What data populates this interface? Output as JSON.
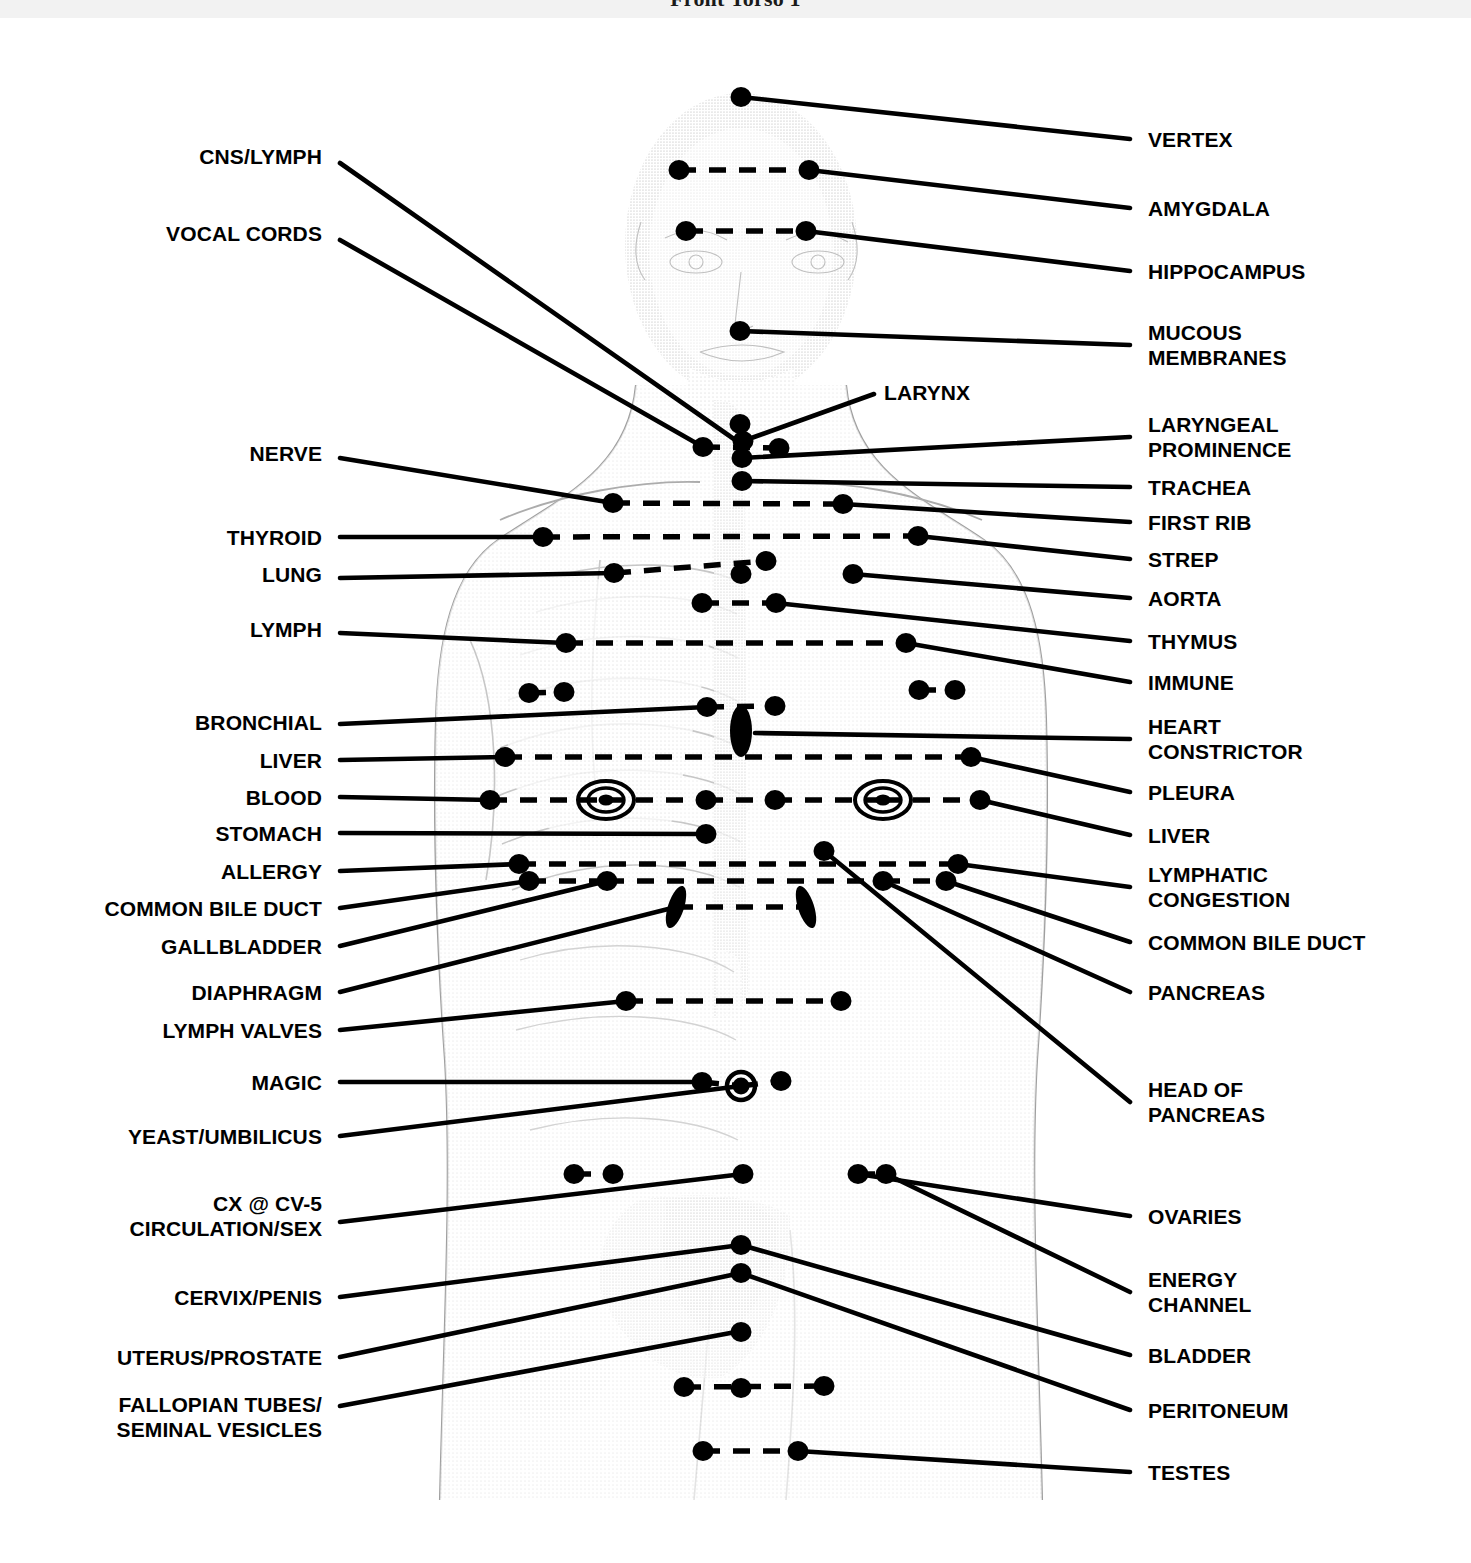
{
  "page": {
    "title": "Front Torso 1",
    "background_color": "#ffffff",
    "ink_color": "#000000",
    "figure_tint": "#c9c9c9"
  },
  "diagram": {
    "type": "anatomical-point-chart",
    "marker_types": [
      "solid-dot",
      "ringed-dot",
      "concentric-circle",
      "filled-oval"
    ],
    "connector_styles": [
      "solid-leader-line",
      "dashed-bilateral-link"
    ]
  },
  "left_labels": [
    {
      "text": "CNS/LYMPH",
      "x": 322,
      "y": 156,
      "tip_x": 340,
      "tip_y": 163,
      "end_x": 741,
      "end_y": 444
    },
    {
      "text": "VOCAL CORDS",
      "x": 322,
      "y": 233,
      "tip_x": 340,
      "tip_y": 240,
      "end_x": 703,
      "end_y": 447
    },
    {
      "text": "NERVE",
      "x": 322,
      "y": 453,
      "tip_x": 340,
      "tip_y": 458,
      "end_x": 613,
      "end_y": 503
    },
    {
      "text": "THYROID",
      "x": 322,
      "y": 537,
      "tip_x": 340,
      "tip_y": 537,
      "end_x": 543,
      "end_y": 537
    },
    {
      "text": "LUNG",
      "x": 322,
      "y": 574,
      "tip_x": 340,
      "tip_y": 578,
      "end_x": 614,
      "end_y": 573
    },
    {
      "text": "LYMPH",
      "x": 322,
      "y": 629,
      "tip_x": 340,
      "tip_y": 633,
      "end_x": 566,
      "end_y": 643
    },
    {
      "text": "BRONCHIAL",
      "x": 322,
      "y": 722,
      "tip_x": 340,
      "tip_y": 724,
      "end_x": 707,
      "end_y": 707
    },
    {
      "text": "LIVER",
      "x": 322,
      "y": 760,
      "tip_x": 340,
      "tip_y": 760,
      "end_x": 505,
      "end_y": 757
    },
    {
      "text": "BLOOD",
      "x": 322,
      "y": 797,
      "tip_x": 340,
      "tip_y": 797,
      "end_x": 490,
      "end_y": 800
    },
    {
      "text": "STOMACH",
      "x": 322,
      "y": 833,
      "tip_x": 340,
      "tip_y": 833,
      "end_x": 706,
      "end_y": 834
    },
    {
      "text": "ALLERGY",
      "x": 322,
      "y": 871,
      "tip_x": 340,
      "tip_y": 871,
      "end_x": 519,
      "end_y": 864
    },
    {
      "text": "COMMON BILE DUCT",
      "x": 322,
      "y": 908,
      "tip_x": 340,
      "tip_y": 908,
      "end_x": 529,
      "end_y": 881
    },
    {
      "text": "GALLBLADDER",
      "x": 322,
      "y": 946,
      "tip_x": 340,
      "tip_y": 946,
      "end_x": 607,
      "end_y": 881
    },
    {
      "text": "DIAPHRAGM",
      "x": 322,
      "y": 992,
      "tip_x": 340,
      "tip_y": 992,
      "end_x": 676,
      "end_y": 907
    },
    {
      "text": "LYMPH VALVES",
      "x": 322,
      "y": 1030,
      "tip_x": 340,
      "tip_y": 1030,
      "end_x": 626,
      "end_y": 1001
    },
    {
      "text": "MAGIC",
      "x": 322,
      "y": 1082,
      "tip_x": 340,
      "tip_y": 1082,
      "end_x": 702,
      "end_y": 1082
    },
    {
      "text": "YEAST/UMBILICUS",
      "x": 322,
      "y": 1136,
      "tip_x": 340,
      "tip_y": 1136,
      "end_x": 741,
      "end_y": 1086
    },
    {
      "text": "CX @ CV-5\nCIRCULATION/SEX",
      "x": 322,
      "y": 1216,
      "tip_x": 340,
      "tip_y": 1222,
      "end_x": 743,
      "end_y": 1174
    },
    {
      "text": "CERVIX/PENIS",
      "x": 322,
      "y": 1297,
      "tip_x": 340,
      "tip_y": 1297,
      "end_x": 741,
      "end_y": 1245
    },
    {
      "text": "UTERUS/PROSTATE",
      "x": 322,
      "y": 1357,
      "tip_x": 340,
      "tip_y": 1357,
      "end_x": 741,
      "end_y": 1273
    },
    {
      "text": "FALLOPIAN TUBES/\nSEMINAL VESICLES",
      "x": 322,
      "y": 1417,
      "tip_x": 340,
      "tip_y": 1406,
      "end_x": 741,
      "end_y": 1331
    }
  ],
  "right_labels": [
    {
      "text": "VERTEX",
      "x": 1148,
      "y": 139,
      "tip_x": 1130,
      "tip_y": 139,
      "end_x": 741,
      "end_y": 97
    },
    {
      "text": "AMYGDALA",
      "x": 1148,
      "y": 208,
      "tip_x": 1130,
      "tip_y": 208,
      "end_x": 809,
      "end_y": 170
    },
    {
      "text": "HIPPOCAMPUS",
      "x": 1148,
      "y": 271,
      "tip_x": 1130,
      "tip_y": 271,
      "end_x": 806,
      "end_y": 231
    },
    {
      "text": "MUCOUS\nMEMBRANES",
      "x": 1148,
      "y": 345,
      "tip_x": 1130,
      "tip_y": 345,
      "end_x": 740,
      "end_y": 331
    },
    {
      "text": "LARYNGEAL\nPROMINENCE",
      "x": 1148,
      "y": 437,
      "tip_x": 1130,
      "tip_y": 437,
      "end_x": 742,
      "end_y": 458
    },
    {
      "text": "TRACHEA",
      "x": 1148,
      "y": 487,
      "tip_x": 1130,
      "tip_y": 487,
      "end_x": 742,
      "end_y": 481
    },
    {
      "text": "FIRST RIB",
      "x": 1148,
      "y": 522,
      "tip_x": 1130,
      "tip_y": 522,
      "end_x": 843,
      "end_y": 504
    },
    {
      "text": "STREP",
      "x": 1148,
      "y": 559,
      "tip_x": 1130,
      "tip_y": 559,
      "end_x": 918,
      "end_y": 536
    },
    {
      "text": "AORTA",
      "x": 1148,
      "y": 598,
      "tip_x": 1130,
      "tip_y": 598,
      "end_x": 853,
      "end_y": 574
    },
    {
      "text": "THYMUS",
      "x": 1148,
      "y": 641,
      "tip_x": 1130,
      "tip_y": 641,
      "end_x": 776,
      "end_y": 603
    },
    {
      "text": "IMMUNE",
      "x": 1148,
      "y": 682,
      "tip_x": 1130,
      "tip_y": 682,
      "end_x": 906,
      "end_y": 643
    },
    {
      "text": "HEART\nCONSTRICTOR",
      "x": 1148,
      "y": 739,
      "tip_x": 1130,
      "tip_y": 739,
      "end_x": 755,
      "end_y": 733
    },
    {
      "text": "PLEURA",
      "x": 1148,
      "y": 792,
      "tip_x": 1130,
      "tip_y": 792,
      "end_x": 971,
      "end_y": 757
    },
    {
      "text": "LIVER",
      "x": 1148,
      "y": 835,
      "tip_x": 1130,
      "tip_y": 835,
      "end_x": 980,
      "end_y": 800
    },
    {
      "text": "LYMPHATIC\nCONGESTION",
      "x": 1148,
      "y": 887,
      "tip_x": 1130,
      "tip_y": 887,
      "end_x": 958,
      "end_y": 864
    },
    {
      "text": "COMMON BILE DUCT",
      "x": 1148,
      "y": 942,
      "tip_x": 1130,
      "tip_y": 942,
      "end_x": 946,
      "end_y": 881
    },
    {
      "text": "PANCREAS",
      "x": 1148,
      "y": 992,
      "tip_x": 1130,
      "tip_y": 992,
      "end_x": 883,
      "end_y": 881
    },
    {
      "text": "HEAD OF\nPANCREAS",
      "x": 1148,
      "y": 1102,
      "tip_x": 1130,
      "tip_y": 1102,
      "end_x": 824,
      "end_y": 851
    },
    {
      "text": "OVARIES",
      "x": 1148,
      "y": 1216,
      "tip_x": 1130,
      "tip_y": 1216,
      "end_x": 858,
      "end_y": 1174
    },
    {
      "text": "ENERGY\nCHANNEL",
      "x": 1148,
      "y": 1292,
      "tip_x": 1130,
      "tip_y": 1292,
      "end_x": 886,
      "end_y": 1174
    },
    {
      "text": "BLADDER",
      "x": 1148,
      "y": 1355,
      "tip_x": 1130,
      "tip_y": 1355,
      "end_x": 741,
      "end_y": 1245
    },
    {
      "text": "PERITONEUM",
      "x": 1148,
      "y": 1410,
      "tip_x": 1130,
      "tip_y": 1410,
      "end_x": 741,
      "end_y": 1273
    },
    {
      "text": "TESTES",
      "x": 1148,
      "y": 1472,
      "tip_x": 1130,
      "tip_y": 1472,
      "end_x": 798,
      "end_y": 1451
    }
  ],
  "inline_labels": [
    {
      "text": "LARYNX",
      "x": 884,
      "y": 392,
      "tip_x": 874,
      "tip_y": 394,
      "end_x": 743,
      "end_y": 441
    }
  ],
  "markers": {
    "dots": [
      {
        "x": 741,
        "y": 97
      },
      {
        "x": 679,
        "y": 170
      },
      {
        "x": 809,
        "y": 170
      },
      {
        "x": 686,
        "y": 231
      },
      {
        "x": 806,
        "y": 231
      },
      {
        "x": 740,
        "y": 331
      },
      {
        "x": 740,
        "y": 424
      },
      {
        "x": 743,
        "y": 441
      },
      {
        "x": 703,
        "y": 447
      },
      {
        "x": 779,
        "y": 448
      },
      {
        "x": 742,
        "y": 458
      },
      {
        "x": 742,
        "y": 481
      },
      {
        "x": 613,
        "y": 503
      },
      {
        "x": 843,
        "y": 504
      },
      {
        "x": 543,
        "y": 537
      },
      {
        "x": 918,
        "y": 536
      },
      {
        "x": 614,
        "y": 573
      },
      {
        "x": 766,
        "y": 561
      },
      {
        "x": 741,
        "y": 574
      },
      {
        "x": 853,
        "y": 574
      },
      {
        "x": 702,
        "y": 603
      },
      {
        "x": 776,
        "y": 603
      },
      {
        "x": 566,
        "y": 643
      },
      {
        "x": 906,
        "y": 643
      },
      {
        "x": 529,
        "y": 693
      },
      {
        "x": 564,
        "y": 692
      },
      {
        "x": 707,
        "y": 707
      },
      {
        "x": 775,
        "y": 706
      },
      {
        "x": 919,
        "y": 690
      },
      {
        "x": 955,
        "y": 690
      },
      {
        "x": 505,
        "y": 757
      },
      {
        "x": 971,
        "y": 757
      },
      {
        "x": 490,
        "y": 800
      },
      {
        "x": 706,
        "y": 800
      },
      {
        "x": 775,
        "y": 800
      },
      {
        "x": 980,
        "y": 800
      },
      {
        "x": 706,
        "y": 834
      },
      {
        "x": 519,
        "y": 864
      },
      {
        "x": 824,
        "y": 851
      },
      {
        "x": 958,
        "y": 864
      },
      {
        "x": 529,
        "y": 881
      },
      {
        "x": 607,
        "y": 881
      },
      {
        "x": 883,
        "y": 881
      },
      {
        "x": 946,
        "y": 881
      },
      {
        "x": 626,
        "y": 1001
      },
      {
        "x": 841,
        "y": 1001
      },
      {
        "x": 702,
        "y": 1082
      },
      {
        "x": 781,
        "y": 1081
      },
      {
        "x": 574,
        "y": 1174
      },
      {
        "x": 613,
        "y": 1174
      },
      {
        "x": 743,
        "y": 1174
      },
      {
        "x": 858,
        "y": 1174
      },
      {
        "x": 886,
        "y": 1174
      },
      {
        "x": 741,
        "y": 1245
      },
      {
        "x": 741,
        "y": 1273
      },
      {
        "x": 741,
        "y": 1332
      },
      {
        "x": 741,
        "y": 1388
      },
      {
        "x": 684,
        "y": 1387
      },
      {
        "x": 824,
        "y": 1386
      },
      {
        "x": 703,
        "y": 1451
      },
      {
        "x": 798,
        "y": 1451
      }
    ],
    "ringed_dots": [
      {
        "x": 741,
        "y": 1086,
        "r": 14
      }
    ],
    "concentric": [
      {
        "x": 606,
        "y": 800,
        "r": 24
      },
      {
        "x": 883,
        "y": 800,
        "r": 24
      }
    ],
    "ovals": [
      {
        "x": 741,
        "y": 731,
        "rx": 11,
        "ry": 26,
        "rot": 0
      },
      {
        "x": 676,
        "y": 907,
        "rx": 8,
        "ry": 22,
        "rot": 18
      },
      {
        "x": 806,
        "y": 907,
        "rx": 8,
        "ry": 22,
        "rot": -18
      }
    ]
  },
  "dashed_links": [
    {
      "x1": 679,
      "y1": 170,
      "x2": 809,
      "y2": 170
    },
    {
      "x1": 686,
      "y1": 231,
      "x2": 806,
      "y2": 231
    },
    {
      "x1": 703,
      "y1": 447,
      "x2": 779,
      "y2": 448
    },
    {
      "x1": 613,
      "y1": 503,
      "x2": 843,
      "y2": 504
    },
    {
      "x1": 543,
      "y1": 537,
      "x2": 918,
      "y2": 536
    },
    {
      "x1": 614,
      "y1": 573,
      "x2": 766,
      "y2": 561
    },
    {
      "x1": 702,
      "y1": 603,
      "x2": 776,
      "y2": 603
    },
    {
      "x1": 566,
      "y1": 643,
      "x2": 906,
      "y2": 643
    },
    {
      "x1": 529,
      "y1": 693,
      "x2": 564,
      "y2": 692
    },
    {
      "x1": 707,
      "y1": 707,
      "x2": 775,
      "y2": 706
    },
    {
      "x1": 919,
      "y1": 690,
      "x2": 955,
      "y2": 690
    },
    {
      "x1": 505,
      "y1": 757,
      "x2": 971,
      "y2": 757
    },
    {
      "x1": 490,
      "y1": 800,
      "x2": 606,
      "y2": 800
    },
    {
      "x1": 606,
      "y1": 800,
      "x2": 706,
      "y2": 800
    },
    {
      "x1": 706,
      "y1": 800,
      "x2": 775,
      "y2": 800
    },
    {
      "x1": 775,
      "y1": 800,
      "x2": 883,
      "y2": 800
    },
    {
      "x1": 883,
      "y1": 800,
      "x2": 980,
      "y2": 800
    },
    {
      "x1": 519,
      "y1": 864,
      "x2": 958,
      "y2": 864
    },
    {
      "x1": 529,
      "y1": 881,
      "x2": 607,
      "y2": 881
    },
    {
      "x1": 607,
      "y1": 881,
      "x2": 883,
      "y2": 881
    },
    {
      "x1": 883,
      "y1": 881,
      "x2": 946,
      "y2": 881
    },
    {
      "x1": 676,
      "y1": 907,
      "x2": 806,
      "y2": 907
    },
    {
      "x1": 626,
      "y1": 1001,
      "x2": 841,
      "y2": 1001
    },
    {
      "x1": 702,
      "y1": 1082,
      "x2": 741,
      "y2": 1086
    },
    {
      "x1": 741,
      "y1": 1086,
      "x2": 781,
      "y2": 1081
    },
    {
      "x1": 574,
      "y1": 1174,
      "x2": 613,
      "y2": 1174
    },
    {
      "x1": 858,
      "y1": 1174,
      "x2": 886,
      "y2": 1174
    },
    {
      "x1": 684,
      "y1": 1387,
      "x2": 824,
      "y2": 1386
    },
    {
      "x1": 703,
      "y1": 1451,
      "x2": 798,
      "y2": 1451
    }
  ]
}
